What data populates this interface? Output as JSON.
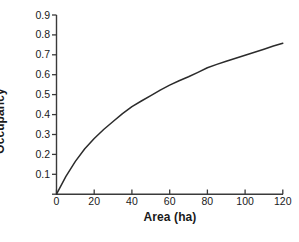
{
  "figure": {
    "background_color": "#ffffff",
    "line_color": "#2b2b2b",
    "axis_color": "#3a3a3a"
  },
  "chart_data": {
    "type": "line",
    "title": "",
    "xlabel": "Area (ha)",
    "ylabel": "Occupancy",
    "xlim": [
      0,
      120
    ],
    "ylim": [
      0,
      0.9
    ],
    "grid": false,
    "legend": null,
    "x_ticks": [
      0,
      20,
      40,
      60,
      80,
      100,
      120
    ],
    "x_tick_labels": [
      "0",
      "20",
      "40",
      "60",
      "80",
      "100",
      "120"
    ],
    "y_ticks": [
      0,
      0.1,
      0.2,
      0.3,
      0.4,
      0.5,
      0.6,
      0.7,
      0.8,
      0.9
    ],
    "y_tick_labels": [
      "",
      "0.1",
      "0.2",
      "0.3",
      "0.4",
      "0.5",
      "0.6",
      "0.7",
      "0.8",
      "0.9"
    ],
    "series": [
      {
        "name": "Occupancy",
        "x": [
          0,
          5,
          10,
          15,
          20,
          25,
          30,
          35,
          40,
          45,
          50,
          55,
          60,
          65,
          70,
          75,
          80,
          85,
          90,
          95,
          100,
          105,
          110,
          115,
          120
        ],
        "values": [
          0.0,
          0.09,
          0.165,
          0.228,
          0.28,
          0.325,
          0.365,
          0.405,
          0.44,
          0.468,
          0.495,
          0.523,
          0.548,
          0.57,
          0.59,
          0.612,
          0.635,
          0.652,
          0.668,
          0.683,
          0.698,
          0.713,
          0.728,
          0.744,
          0.758
        ]
      }
    ],
    "caption_fragment": ""
  },
  "axis": {
    "x_title": "Area (ha)",
    "y_title": "Occupancy"
  }
}
